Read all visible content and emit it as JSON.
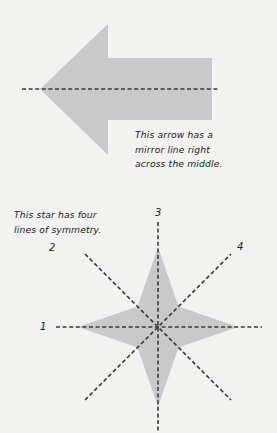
{
  "page": {
    "background_color": "#f2f2f0",
    "width": 277,
    "height": 433,
    "text_color": "#1b1b1b"
  },
  "arrow_figure": {
    "name": "left-pointing-arrow-with-horizontal-mirror-line",
    "shape_fill_color": "#c9c9c9",
    "mirror_line_color": "#3a3a3a",
    "mirror_line_style": "dashed",
    "mirror_line_orientation": "horizontal",
    "lines_of_symmetry": 1,
    "caption": "This arrow has a\nmirror line right\nacross the middle.",
    "geometry": {
      "tip_x": 40,
      "tip_y": 89,
      "head_top_y": 24,
      "head_bottom_y": 155,
      "head_base_x": 108,
      "shaft_top_y": 58,
      "shaft_bottom_y": 120,
      "shaft_right_x": 212,
      "mirror_line_x1": 22,
      "mirror_line_x2": 218,
      "mirror_line_y": 89
    }
  },
  "star_figure": {
    "name": "eight-pointed-star-with-four-lines-of-symmetry",
    "shape_fill_color": "#c9c9c9",
    "mirror_line_color": "#3a3a3a",
    "mirror_line_style": "dashed",
    "lines_of_symmetry": 4,
    "caption": "This star has four\nlines of symmetry.",
    "center_x": 158,
    "center_y": 327,
    "long_point_radius": 80,
    "short_point_radius": 29,
    "labels": [
      {
        "text": "1",
        "x": 40,
        "y": 322,
        "line": "horizontal"
      },
      {
        "text": "2",
        "x": 49,
        "y": 243,
        "line": "diagonal-up-right"
      },
      {
        "text": "3",
        "x": 155,
        "y": 208,
        "line": "vertical"
      },
      {
        "text": "4",
        "x": 237,
        "y": 242,
        "line": "diagonal-up-left"
      }
    ],
    "mirror_lines": [
      {
        "id": "1",
        "orientation": "horizontal",
        "angle_deg": 0
      },
      {
        "id": "2",
        "orientation": "diagonal",
        "angle_deg": 45
      },
      {
        "id": "3",
        "orientation": "vertical",
        "angle_deg": 90
      },
      {
        "id": "4",
        "orientation": "diagonal",
        "angle_deg": 135
      }
    ]
  }
}
